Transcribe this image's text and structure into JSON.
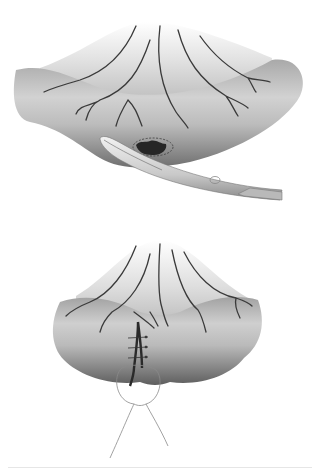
{
  "figure": {
    "panels": [
      {
        "id": "top",
        "caption": "Bowel loop with mesentery; curved scissors excising lesion within dashed circular margin",
        "elements": [
          "mesentery-fan",
          "mesenteric-vessels",
          "bowel-loop",
          "dashed-excision-margin",
          "lesion-defect",
          "curved-scissors"
        ]
      },
      {
        "id": "bottom",
        "caption": "Bowel closed with interrupted sutures; purse-string suture loop at base",
        "elements": [
          "mesentery-fan",
          "mesenteric-vessels",
          "bowel-loop",
          "suture-line",
          "interrupted-sutures",
          "purse-string-suture"
        ]
      }
    ],
    "colors": {
      "background": "#ffffff",
      "tissue_light": "#e4e4e4",
      "tissue_mid": "#b5b5b5",
      "tissue_dark": "#6e6e6e",
      "vessel": "#3a3a3a",
      "instrument": "#d8d8d8",
      "suture": "#8a8a8a"
    },
    "suture_count": 3
  }
}
